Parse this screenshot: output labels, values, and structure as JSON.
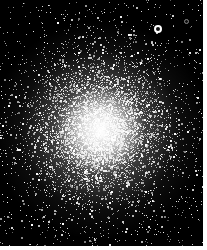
{
  "image": {
    "subject": "globular star cluster",
    "background_color": "#000000",
    "star_color": "#ffffff",
    "border_color": "#ffffff",
    "core_center": [
      100,
      130
    ],
    "core_radius": 30,
    "halo_radius": 110,
    "bright_stars": [
      {
        "x": 158,
        "y": 29,
        "r": 3
      },
      {
        "x": 186,
        "y": 21,
        "r": 1.5
      }
    ]
  }
}
